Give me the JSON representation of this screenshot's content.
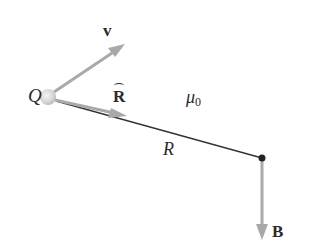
{
  "diagram": {
    "charge": {
      "label": "Q",
      "position": [
        48,
        97
      ]
    },
    "velocity": {
      "label": "v",
      "tip": [
        124,
        44
      ]
    },
    "unit_vector": {
      "label": "R",
      "hat": true,
      "tip": [
        125,
        116
      ]
    },
    "medium": {
      "label": "μ",
      "subscript": "0"
    },
    "distance": {
      "label": "R",
      "end": [
        262,
        158
      ]
    },
    "field": {
      "label": "B",
      "tip": [
        262,
        238
      ]
    },
    "colors": {
      "arrow": "#a9a9a9",
      "line": "#333333",
      "text": "#2b2b2b",
      "charge": "#d8d8d8"
    }
  }
}
